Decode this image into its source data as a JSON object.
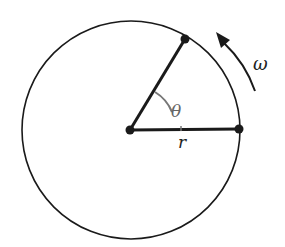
{
  "diagram": {
    "labels": {
      "angle": "θ",
      "radius": "r",
      "angular_velocity": "ω"
    },
    "colors": {
      "stroke": "#1a1a1a",
      "angle_arc": "#777777"
    }
  }
}
